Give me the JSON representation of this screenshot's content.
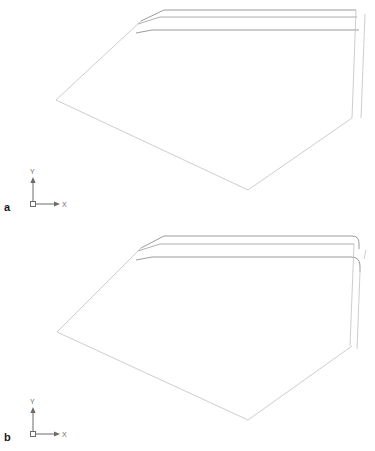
{
  "figure": {
    "type": "technical-line-drawing",
    "background_color": "#ffffff",
    "line_color": "#9a9a9a",
    "axis_color": "#6b6b6b",
    "label_color": "#1a1a1a",
    "panels": [
      {
        "id": "panel-a",
        "label": "a",
        "label_position": {
          "x": 4,
          "y": 211
        },
        "axis_indicator": {
          "origin": {
            "x": 33,
            "y": 204
          },
          "y_label": "Y",
          "x_label": "X",
          "y_label_position": {
            "x": 30,
            "y": 174
          },
          "x_label_position": {
            "x": 62,
            "y": 207
          },
          "y_axis_length": 22,
          "x_axis_length": 22
        },
        "outline_points": "164,10 56,100 248,190 352,118",
        "top_edges": [
          {
            "name": "top-edge-outer",
            "d": "M 141,21 L 164,10 L 356,10"
          },
          {
            "name": "top-edge-middle",
            "d": "M 138,24 L 160,17 L 357,17"
          },
          {
            "name": "top-edge-inner",
            "d": "M 136,33 L 152,30 L 359,30"
          }
        ],
        "side_edges": [
          {
            "name": "left-diagonal",
            "d": "M 141,21 L 56,100"
          },
          {
            "name": "bottom-left-diagonal",
            "d": "M 56,100 L 248,190"
          },
          {
            "name": "bottom-right-diagonal",
            "d": "M 248,190 L 352,118"
          },
          {
            "name": "right-vertical-outer",
            "d": "M 356,10 L 352,118"
          },
          {
            "name": "right-vertical-inner",
            "d": "M 365,14 L 361,118"
          }
        ]
      },
      {
        "id": "panel-b",
        "label": "b",
        "label_position": {
          "x": 4,
          "y": 441
        },
        "axis_indicator": {
          "origin": {
            "x": 33,
            "y": 434
          },
          "y_label": "Y",
          "x_label": "X",
          "y_label_position": {
            "x": 30,
            "y": 404
          },
          "x_label_position": {
            "x": 62,
            "y": 437
          },
          "y_axis_length": 22,
          "x_axis_length": 22
        },
        "outline_points": "164,236 57,332 248,420 352,346",
        "top_edges": [
          {
            "name": "top-edge-outer",
            "d": "M 141,248 L 164,236 L 352,236 Q 359,236 359,243 L 359,248"
          },
          {
            "name": "top-edge-middle",
            "d": "M 138,251 L 160,244 L 354,244"
          },
          {
            "name": "top-edge-inner",
            "d": "M 136,260 L 152,257 L 351,257 Q 360,257 360,266 L 360,272"
          }
        ],
        "side_edges": [
          {
            "name": "left-diagonal",
            "d": "M 141,248 L 57,332"
          },
          {
            "name": "bottom-left-diagonal",
            "d": "M 57,332 L 248,420"
          },
          {
            "name": "bottom-right-diagonal",
            "d": "M 248,420 L 352,346"
          },
          {
            "name": "right-vertical-outer",
            "d": "M 354,244 L 350,346"
          },
          {
            "name": "right-vertical-inner",
            "d": "M 360,272 L 357,348"
          },
          {
            "name": "right-vertical-corner",
            "d": "M 366,250 L 364,258"
          }
        ]
      }
    ]
  }
}
